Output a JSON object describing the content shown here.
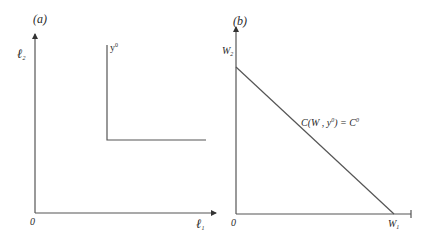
{
  "panels": {
    "a": {
      "title": "(a)",
      "y_axis_label": "ℓ",
      "y_axis_sub": "2",
      "x_axis_label": "ℓ",
      "x_axis_sub": "1",
      "origin_label": "0",
      "isoquant_label": "y",
      "isoquant_sup": "0"
    },
    "b": {
      "title": "(b)",
      "y_axis_label": "W",
      "y_axis_sub": "2",
      "x_axis_label": "W",
      "x_axis_sub": "1",
      "origin_label": "0",
      "isocost_label_prefix": "C(W , y",
      "isocost_label_sup": "0",
      "isocost_label_mid": ") = C",
      "isocost_label_sup2": "0"
    }
  },
  "colors": {
    "line": "#555555",
    "text": "#2a2a2a"
  }
}
